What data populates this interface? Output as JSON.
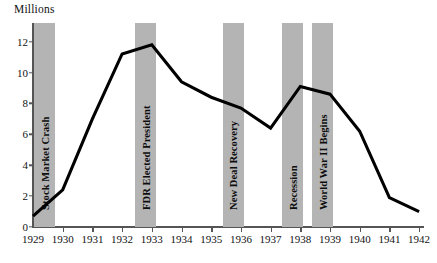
{
  "chart_data": {
    "type": "line",
    "title": "",
    "subtitle": "",
    "xlabel": "",
    "ylabel": "Millions",
    "ylim": [
      0,
      13
    ],
    "xlim": [
      1929,
      1942
    ],
    "grid": false,
    "legend": "none",
    "y_ticks": [
      0,
      2,
      4,
      6,
      8,
      10,
      12
    ],
    "y_tick_labels": [
      "0",
      "2",
      "4",
      "6",
      "8",
      "10",
      "12"
    ],
    "x_ticks": [
      1929,
      1930,
      1931,
      1932,
      1933,
      1934,
      1935,
      1936,
      1937,
      1938,
      1939,
      1940,
      1941,
      1942
    ],
    "x_tick_labels": [
      "1929",
      "1930",
      "1931",
      "1932",
      "1933",
      "1934",
      "1935",
      "1936",
      "1937",
      "1938",
      "1939",
      "1940",
      "1941",
      "1942"
    ],
    "x": [
      1929,
      1930,
      1931,
      1932,
      1933,
      1934,
      1935,
      1936,
      1937,
      1938,
      1939,
      1940,
      1941,
      1942
    ],
    "values": [
      0.7,
      2.4,
      7.0,
      11.2,
      11.8,
      9.4,
      8.4,
      7.7,
      6.4,
      9.1,
      8.6,
      6.2,
      1.9,
      1.0
    ],
    "series": [
      {
        "name": "Unemployment (Millions)",
        "values": [
          0.7,
          2.4,
          7.0,
          11.2,
          11.8,
          9.4,
          8.4,
          7.7,
          6.4,
          9.1,
          8.6,
          6.2,
          1.9,
          1.0
        ],
        "color": "#000000"
      }
    ],
    "annotations": [
      {
        "label": "Stock Market Crash",
        "x_start": 1929.05,
        "x_end": 1929.75,
        "color": "#b4b4b4"
      },
      {
        "label": "FDR Elected President",
        "x_start": 1932.45,
        "x_end": 1933.15,
        "color": "#b4b4b4"
      },
      {
        "label": "New Deal Recovery",
        "x_start": 1935.4,
        "x_end": 1936.1,
        "color": "#b4b4b4"
      },
      {
        "label": "Recession",
        "x_start": 1937.4,
        "x_end": 1938.1,
        "color": "#b4b4b4"
      },
      {
        "label": "World War II Begins",
        "x_start": 1938.4,
        "x_end": 1939.1,
        "color": "#b4b4b4"
      }
    ]
  }
}
